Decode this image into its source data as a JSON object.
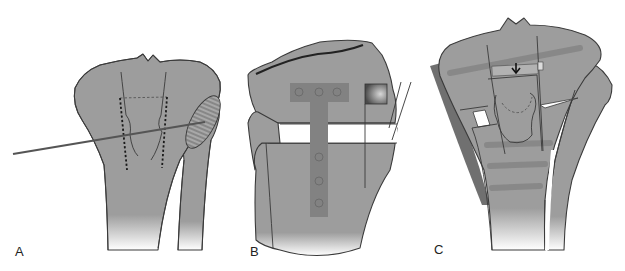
{
  "figure": {
    "panels": [
      {
        "label": "A",
        "description": "Proximal tibia with guide wire and dashed osteotomy outline; hatched fibular head"
      },
      {
        "label": "B",
        "description": "Opening-wedge osteotomy fixed with T-plate and screw holes; graft block"
      },
      {
        "label": "C",
        "description": "Corrected tibia with wedge, arrow indicating compression and horizontal screws"
      }
    ],
    "colors": {
      "bone": "#9d9d9d",
      "outline": "#3a3a3a",
      "plate": "#828282",
      "background": "#ffffff"
    }
  }
}
